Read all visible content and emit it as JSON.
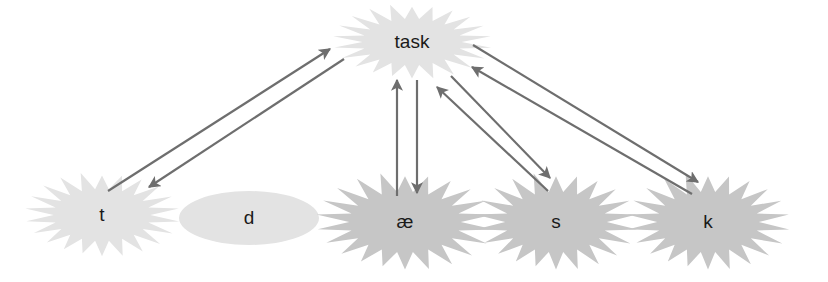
{
  "diagram": {
    "type": "directed-graph",
    "colors": {
      "light_node": "#e3e3e3",
      "dark_node": "#c6c6c6",
      "edge": "#6e6e6e",
      "text": "#1a1a1a"
    },
    "nodes": [
      {
        "id": "task",
        "label": "task",
        "shape": "starburst",
        "shade": "light",
        "cx": 412,
        "cy": 42,
        "rx": 80,
        "ry": 40
      },
      {
        "id": "t",
        "label": "t",
        "shape": "starburst",
        "shade": "light",
        "cx": 102,
        "cy": 215,
        "rx": 78,
        "ry": 45
      },
      {
        "id": "d",
        "label": "d",
        "shape": "ellipse",
        "shade": "light",
        "cx": 249,
        "cy": 218,
        "rx": 70,
        "ry": 27
      },
      {
        "id": "ae",
        "label": "æ",
        "shape": "starburst",
        "shade": "dark",
        "cx": 405,
        "cy": 222,
        "rx": 90,
        "ry": 52
      },
      {
        "id": "s",
        "label": "s",
        "shape": "starburst",
        "shade": "dark",
        "cx": 556,
        "cy": 222,
        "rx": 82,
        "ry": 52
      },
      {
        "id": "k",
        "label": "k",
        "shape": "starburst",
        "shade": "dark",
        "cx": 708,
        "cy": 222,
        "rx": 82,
        "ry": 52
      }
    ],
    "edges": [
      {
        "from": "t",
        "to": "task",
        "x1": 108,
        "y1": 191,
        "x2": 330,
        "y2": 49
      },
      {
        "from": "task",
        "to": "t",
        "x1": 344,
        "y1": 59,
        "x2": 149,
        "y2": 187
      },
      {
        "from": "ae",
        "to": "task",
        "x1": 397,
        "y1": 196,
        "x2": 397,
        "y2": 80
      },
      {
        "from": "task",
        "to": "ae",
        "x1": 417,
        "y1": 80,
        "x2": 417,
        "y2": 193
      },
      {
        "from": "s",
        "to": "task",
        "x1": 548,
        "y1": 191,
        "x2": 437,
        "y2": 87
      },
      {
        "from": "task",
        "to": "s",
        "x1": 451,
        "y1": 76,
        "x2": 550,
        "y2": 178
      },
      {
        "from": "k",
        "to": "task",
        "x1": 692,
        "y1": 194,
        "x2": 472,
        "y2": 67
      },
      {
        "from": "task",
        "to": "k",
        "x1": 473,
        "y1": 45,
        "x2": 698,
        "y2": 182
      }
    ]
  }
}
